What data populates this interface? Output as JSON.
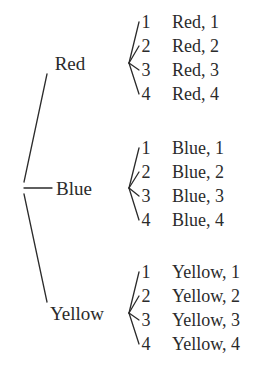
{
  "diagram": {
    "type": "probability-tree",
    "ink_color": "#2b2b2b",
    "background_color": "#ffffff",
    "root": {
      "x": 22,
      "y": 188
    },
    "branches": [
      {
        "label": "Red",
        "label_x": 70,
        "label_y": 63,
        "fan_x": 121,
        "fan_y": 63,
        "stem": {
          "x1": 24,
          "y1": 182,
          "x2": 47,
          "y2": 74
        },
        "leaves": [
          {
            "digit": "1",
            "outcome": "Red, 1",
            "y": 22
          },
          {
            "digit": "2",
            "outcome": "Red, 2",
            "y": 46
          },
          {
            "digit": "3",
            "outcome": "Red, 3",
            "y": 70
          },
          {
            "digit": "4",
            "outcome": "Red, 4",
            "y": 94
          }
        ]
      },
      {
        "label": "Blue",
        "label_x": 74,
        "label_y": 188,
        "fan_x": 121,
        "fan_y": 188,
        "stem": {
          "x1": 24,
          "y1": 188,
          "x2": 52,
          "y2": 188
        },
        "leaves": [
          {
            "digit": "1",
            "outcome": "Blue, 1",
            "y": 148
          },
          {
            "digit": "2",
            "outcome": "Blue, 2",
            "y": 172
          },
          {
            "digit": "3",
            "outcome": "Blue, 3",
            "y": 196
          },
          {
            "digit": "4",
            "outcome": "Blue, 4",
            "y": 220
          }
        ]
      },
      {
        "label": "Yellow",
        "label_x": 77,
        "label_y": 313,
        "fan_x": 121,
        "fan_y": 313,
        "stem": {
          "x1": 24,
          "y1": 194,
          "x2": 47,
          "y2": 302
        },
        "leaves": [
          {
            "digit": "1",
            "outcome": "Yellow, 1",
            "y": 272
          },
          {
            "digit": "2",
            "outcome": "Yellow, 2",
            "y": 296
          },
          {
            "digit": "3",
            "outcome": "Yellow, 3",
            "y": 320
          },
          {
            "digit": "4",
            "outcome": "Yellow, 4",
            "y": 344
          }
        ]
      }
    ],
    "geometry": {
      "digit_x": 146,
      "outcome_x": 172,
      "fan_start_x": 129,
      "leaf_end_x": 139
    }
  }
}
